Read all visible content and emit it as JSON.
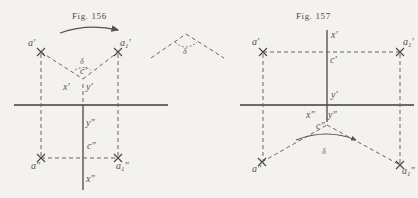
{
  "page": {
    "background_color": "#f4f2ee",
    "ink_color": "#54504b",
    "width": 418,
    "height": 198
  },
  "figures": [
    {
      "id": "fig-156",
      "title": "Fig. 156",
      "title_x": 72,
      "title_y": 11,
      "rotation_arrow": {
        "name": "rotation-arrow",
        "x": 60,
        "y": 28,
        "width": 60
      },
      "ground_line": {
        "x1": 14,
        "y1": 105,
        "x2": 168,
        "y2": 105
      },
      "points": [
        {
          "name": "a-prime",
          "label": "a",
          "prime": "′",
          "sub": "",
          "x": 41,
          "y": 52,
          "lx": 28,
          "ly": 38
        },
        {
          "name": "a1-prime",
          "label": "a",
          "prime": "′",
          "sub": "1",
          "x": 118,
          "y": 52,
          "lx": 120,
          "ly": 38
        },
        {
          "name": "c-prime",
          "label": "c",
          "prime": "′",
          "sub": "",
          "x": 83,
          "y": 79,
          "lx": 80,
          "ly": 66
        },
        {
          "name": "x-prime",
          "label": "x",
          "prime": "′",
          "sub": "",
          "x": 74,
          "y": 88,
          "lx": 65,
          "ly": 82
        },
        {
          "name": "y-prime",
          "label": "y",
          "prime": "′",
          "sub": "",
          "x": 90,
          "y": 88,
          "lx": 86,
          "ly": 82
        },
        {
          "name": "y-double",
          "label": "y",
          "prime": "″",
          "sub": "",
          "x": 83,
          "y": 126,
          "lx": 85,
          "ly": 118
        },
        {
          "name": "c-double",
          "label": "c",
          "prime": "″",
          "sub": "",
          "x": 83,
          "y": 158,
          "lx": 86,
          "ly": 142
        },
        {
          "name": "a-double",
          "label": "a",
          "prime": "″",
          "sub": "",
          "x": 41,
          "y": 158,
          "lx": 33,
          "ly": 161
        },
        {
          "name": "a1-double",
          "label": "a",
          "prime": "″",
          "sub": "1",
          "x": 118,
          "y": 158,
          "lx": 118,
          "ly": 161
        },
        {
          "name": "x-double",
          "label": "x",
          "prime": "″",
          "sub": "",
          "x": 83,
          "y": 180,
          "lx": 86,
          "ly": 174
        }
      ],
      "delta_label": {
        "name": "delta-angle-label",
        "text": "δ",
        "x": 80,
        "y": 61
      }
    },
    {
      "id": "fig-157",
      "title": "Fig. 157",
      "title_x": 296,
      "title_y": 11,
      "ground_line": {
        "x1": 240,
        "y1": 105,
        "x2": 414,
        "y2": 105
      },
      "points": [
        {
          "name": "a-prime",
          "label": "a",
          "prime": "′",
          "sub": "",
          "x": 263,
          "y": 52,
          "lx": 252,
          "ly": 38
        },
        {
          "name": "a1-prime",
          "label": "a",
          "prime": "′",
          "sub": "1",
          "x": 400,
          "y": 52,
          "lx": 403,
          "ly": 38
        },
        {
          "name": "c-prime",
          "label": "c",
          "prime": "′",
          "sub": "",
          "x": 327,
          "y": 52,
          "lx": 329,
          "ly": 54
        },
        {
          "name": "x-prime",
          "label": "x",
          "prime": "′",
          "sub": "",
          "x": 327,
          "y": 36,
          "lx": 330,
          "ly": 30
        },
        {
          "name": "y-prime",
          "label": "y",
          "prime": "′",
          "sub": "",
          "x": 327,
          "y": 95,
          "lx": 330,
          "ly": 92
        },
        {
          "name": "x-double",
          "label": "x",
          "prime": "″",
          "sub": "",
          "x": 318,
          "y": 118,
          "lx": 310,
          "ly": 112
        },
        {
          "name": "y-double",
          "label": "y",
          "prime": "″",
          "sub": "",
          "x": 334,
          "y": 118,
          "lx": 331,
          "ly": 112
        },
        {
          "name": "c-double",
          "label": "c",
          "prime": "″",
          "sub": "",
          "x": 327,
          "y": 125,
          "lx": 320,
          "ly": 122
        },
        {
          "name": "a-double",
          "label": "a",
          "prime": "″",
          "sub": "",
          "x": 262,
          "y": 162,
          "lx": 254,
          "ly": 165
        },
        {
          "name": "a1-double",
          "label": "a",
          "prime": "″",
          "sub": "1",
          "x": 400,
          "y": 165,
          "lx": 401,
          "ly": 167
        }
      ],
      "delta_label": {
        "name": "delta-angle-label",
        "text": "δ",
        "x": 322,
        "y": 152
      }
    },
    {
      "id": "detached-angle",
      "name": "detached-angle-diagram",
      "apex_x": 186,
      "apex_y": 34,
      "left_x": 151,
      "left_y": 58,
      "right_x": 224,
      "right_y": 58,
      "delta_label": {
        "name": "delta-angle-label",
        "text": "δ",
        "x": 183,
        "y": 44
      }
    }
  ]
}
